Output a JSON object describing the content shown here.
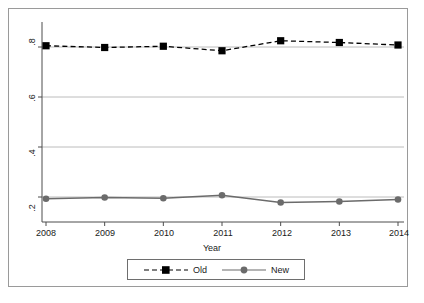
{
  "chart_data": {
    "type": "line",
    "title": "",
    "subtitle": "",
    "xlabel": "Year",
    "ylabel": "",
    "categories": [
      "2008",
      "2009",
      "2010",
      "2011",
      "2012",
      "2013",
      "2014"
    ],
    "x": [
      2008,
      2009,
      2010,
      2011,
      2012,
      2013,
      2014
    ],
    "xlim": [
      2007.7,
      2014.3
    ],
    "ylim": [
      0.1,
      0.9
    ],
    "yticks": [
      ".2",
      ".4",
      ".6",
      ".8"
    ],
    "ytick_values": [
      0.2,
      0.4,
      0.6,
      0.8
    ],
    "xticks": [
      "2008",
      "2009",
      "2010",
      "2011",
      "2012",
      "2013",
      "2014"
    ],
    "grid": "horizontal",
    "legend_position": "bottom-center",
    "series": [
      {
        "name": "Old",
        "color": "#000000",
        "linestyle": "dashed",
        "marker": "square",
        "values": [
          0.805,
          0.798,
          0.803,
          0.785,
          0.825,
          0.818,
          0.808
        ]
      },
      {
        "name": "New",
        "color": "#6b6b6b",
        "linestyle": "solid",
        "marker": "circle",
        "values": [
          0.193,
          0.198,
          0.195,
          0.207,
          0.178,
          0.182,
          0.19
        ]
      }
    ]
  },
  "axes": {
    "x_title": "Year",
    "y_tick_labels": [
      ".2",
      ".4",
      ".6",
      ".8"
    ],
    "x_tick_labels": [
      "2008",
      "2009",
      "2010",
      "2011",
      "2012",
      "2013",
      "2014"
    ]
  },
  "legend": {
    "items": [
      {
        "label": "Old"
      },
      {
        "label": "New"
      }
    ]
  },
  "colors": {
    "old_series": "#000000",
    "new_series": "#6b6b6b",
    "gridline": "#b4b4b4",
    "axis": "#4d4d4d",
    "frame": "#9a9a9a",
    "background": "#ffffff"
  }
}
